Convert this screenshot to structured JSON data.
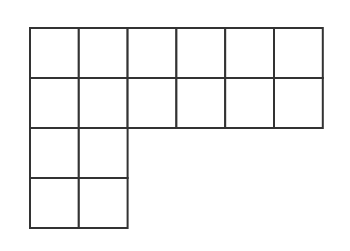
{
  "diagram": {
    "cell_count": 16,
    "layout": {
      "top_block": {
        "rows": 2,
        "cols": 6
      },
      "bottom_block": {
        "rows": 2,
        "cols": 2,
        "aligned": "left"
      }
    },
    "colors": {
      "line": "#333333",
      "fill": "#ffffff"
    },
    "geometry": {
      "origin_x": 30,
      "origin_y": 28,
      "cell_w": 48.8,
      "cell_h": 50
    }
  }
}
